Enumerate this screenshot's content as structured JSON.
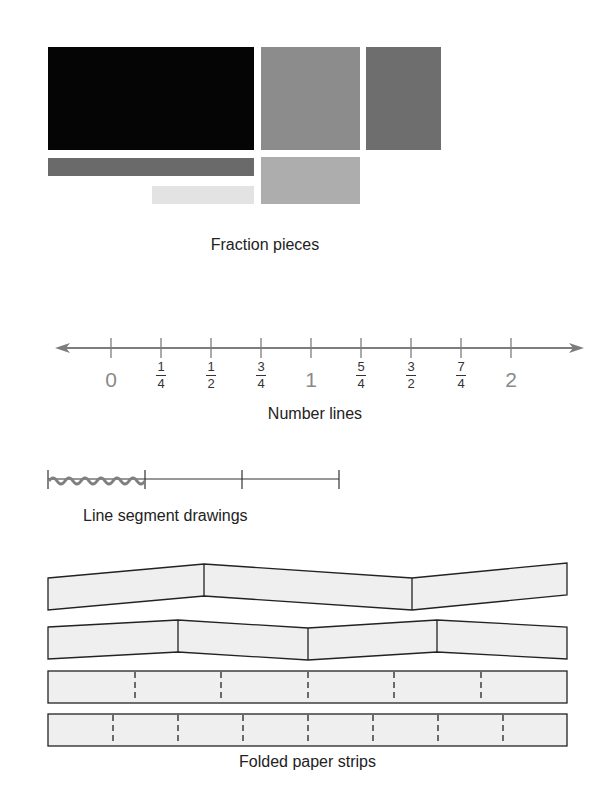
{
  "sections": {
    "fraction_pieces": {
      "caption": "Fraction pieces",
      "pieces": [
        {
          "name": "whole-black",
          "x": 48,
          "y": 47,
          "w": 206,
          "h": 103,
          "color": "#050505"
        },
        {
          "name": "half-gray-square",
          "x": 261,
          "y": 47,
          "w": 99,
          "h": 103,
          "color": "#8c8c8c"
        },
        {
          "name": "dark-gray-rect",
          "x": 366,
          "y": 47,
          "w": 75,
          "h": 103,
          "color": "#6e6e6e"
        },
        {
          "name": "long-bar",
          "x": 48,
          "y": 158,
          "w": 206,
          "h": 18,
          "color": "#6a6a6a"
        },
        {
          "name": "light-bar",
          "x": 152,
          "y": 186,
          "w": 102,
          "h": 18,
          "color": "#e3e3e3"
        },
        {
          "name": "light-gray-rect",
          "x": 261,
          "y": 157,
          "w": 99,
          "h": 47,
          "color": "#adadad"
        }
      ]
    },
    "number_line": {
      "caption": "Number lines",
      "ticks": [
        {
          "x": 111,
          "type": "whole",
          "label": "0"
        },
        {
          "x": 161,
          "type": "frac",
          "num": "1",
          "den": "4"
        },
        {
          "x": 211,
          "type": "frac",
          "num": "1",
          "den": "2"
        },
        {
          "x": 261,
          "type": "frac",
          "num": "3",
          "den": "4"
        },
        {
          "x": 311,
          "type": "whole",
          "label": "1"
        },
        {
          "x": 361,
          "type": "frac",
          "num": "5",
          "den": "4"
        },
        {
          "x": 411,
          "type": "frac",
          "num": "3",
          "den": "2"
        },
        {
          "x": 461,
          "type": "frac",
          "num": "7",
          "den": "4"
        },
        {
          "x": 511,
          "type": "whole",
          "label": "2"
        }
      ]
    },
    "line_segment": {
      "caption": "Line segment drawings"
    },
    "paper_strips": {
      "caption": "Folded paper strips",
      "strip_fill": "#efefef"
    }
  }
}
